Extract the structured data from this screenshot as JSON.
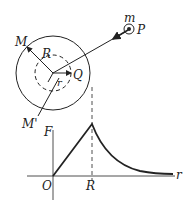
{
  "diagram": {
    "top": {
      "labels": {
        "M": "M",
        "M_prime": "M'",
        "R": "R",
        "r": "r",
        "Q": "Q",
        "m": "m",
        "P": "P"
      },
      "shapes": {
        "outer_circle": "solid",
        "inner_circle": "dashed",
        "particle": "ringed-dot"
      }
    },
    "graph": {
      "labels": {
        "y_axis": "F",
        "x_axis": "r",
        "origin": "O",
        "x_tick": "R"
      },
      "curve": "linear rise from O to peak at R, then inverse-square decay"
    },
    "colors": {
      "stroke": "#222222",
      "background": "#ffffff"
    }
  }
}
